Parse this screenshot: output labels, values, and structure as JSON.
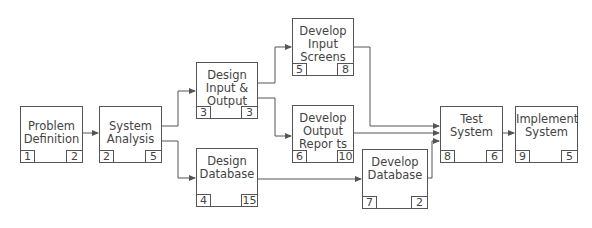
{
  "diagram": {
    "type": "activity-network",
    "nodes": [
      {
        "id": "problem-definition",
        "label": "Problem\nDefinition",
        "left": "1",
        "right": "2"
      },
      {
        "id": "system-analysis",
        "label": "System\nAnalysis",
        "left": "2",
        "right": "5"
      },
      {
        "id": "design-input-output",
        "label": "Design\nInput &\nOutput",
        "left": "3",
        "right": "3"
      },
      {
        "id": "design-database",
        "label": "Design\nDatabase",
        "left": "4",
        "right": "15"
      },
      {
        "id": "develop-input-screens",
        "label": "Develop\nInput\nScreens",
        "left": "5",
        "right": "8"
      },
      {
        "id": "develop-output-reports",
        "label": "Develop\nOutput\nRepor ts",
        "left": "6",
        "right": "10"
      },
      {
        "id": "develop-database",
        "label": "Develop\nDatabase",
        "left": "7",
        "right": "2"
      },
      {
        "id": "test-system",
        "label": "Test\nSystem",
        "left": "8",
        "right": "6"
      },
      {
        "id": "implement-system",
        "label": "Implement\nSystem",
        "left": "9",
        "right": "5"
      }
    ],
    "edges": [
      [
        "problem-definition",
        "system-analysis"
      ],
      [
        "system-analysis",
        "design-input-output"
      ],
      [
        "system-analysis",
        "design-database"
      ],
      [
        "design-input-output",
        "develop-input-screens"
      ],
      [
        "design-input-output",
        "develop-output-reports"
      ],
      [
        "design-database",
        "develop-database"
      ],
      [
        "develop-input-screens",
        "test-system"
      ],
      [
        "develop-output-reports",
        "test-system"
      ],
      [
        "develop-database",
        "test-system"
      ],
      [
        "test-system",
        "implement-system"
      ]
    ]
  }
}
